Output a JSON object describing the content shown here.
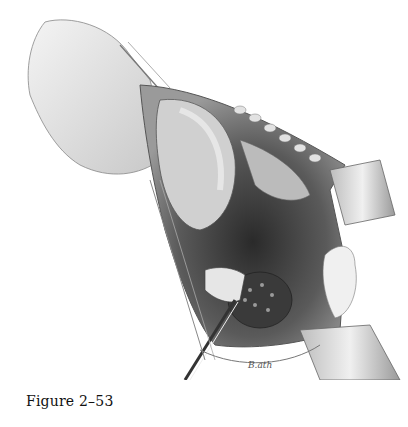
{
  "figure": {
    "caption": "Figure 2–53",
    "signature": "B.ath"
  }
}
